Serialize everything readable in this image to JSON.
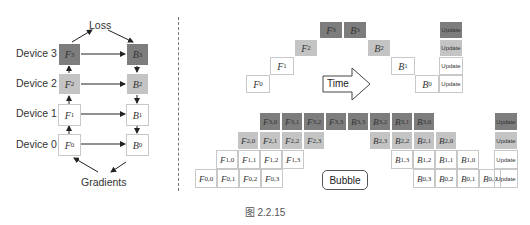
{
  "figure": {
    "caption": "图 2.2.15",
    "colors": {
      "dark": "#7d7d7d",
      "medium": "#c4c4c4",
      "light": "#ffffff",
      "border": "#c8c8c8"
    }
  },
  "left_diagram": {
    "top_label": "Loss",
    "bottom_label": "Gradients",
    "devices": [
      {
        "label": "Device 3",
        "forward": "F",
        "forward_sub": "3",
        "backward": "B",
        "backward_sub": "3",
        "shade": "dark"
      },
      {
        "label": "Device 2",
        "forward": "F",
        "forward_sub": "2",
        "backward": "B",
        "backward_sub": "2",
        "shade": "mid"
      },
      {
        "label": "Device 1",
        "forward": "F",
        "forward_sub": "1",
        "backward": "B",
        "backward_sub": "1",
        "shade": "white"
      },
      {
        "label": "Device 0",
        "forward": "F",
        "forward_sub": "0",
        "backward": "B",
        "backward_sub": "0",
        "shade": "white"
      }
    ]
  },
  "naive_pipeline": {
    "arrow_label": "Time",
    "cells": [
      {
        "text": "F",
        "sub": "0",
        "x": 246,
        "y": 75,
        "shade": "white"
      },
      {
        "text": "F",
        "sub": "1",
        "x": 270,
        "y": 57,
        "shade": "white"
      },
      {
        "text": "F",
        "sub": "2",
        "x": 294,
        "y": 39,
        "shade": "mid"
      },
      {
        "text": "F",
        "sub": "3",
        "x": 319,
        "y": 21,
        "shade": "dark"
      },
      {
        "text": "B",
        "sub": "3",
        "x": 343,
        "y": 21,
        "shade": "dark"
      },
      {
        "text": "B",
        "sub": "2",
        "x": 367,
        "y": 39,
        "shade": "mid"
      },
      {
        "text": "B",
        "sub": "1",
        "x": 391,
        "y": 57,
        "shade": "white"
      },
      {
        "text": "B",
        "sub": "0",
        "x": 415,
        "y": 75,
        "shade": "white"
      }
    ],
    "updates": [
      {
        "label": "Update",
        "shade": "dark"
      },
      {
        "label": "Update",
        "shade": "mid"
      },
      {
        "label": "Update",
        "shade": "white"
      },
      {
        "label": "Update",
        "shade": "white"
      }
    ]
  },
  "gpipe": {
    "bubble_label": "Bubble",
    "rows": [
      {
        "shade": "dark",
        "forward_start": 259,
        "backward_start": 347,
        "forward": [
          "3,0",
          "3,1",
          "3,2",
          "3,3"
        ],
        "backward": [
          "3,3",
          "3,2",
          "3,1",
          "3,0"
        ]
      },
      {
        "shade": "mid",
        "forward_start": 237,
        "backward_start": 369,
        "forward": [
          "2,0",
          "2,1",
          "2,2",
          "2,3"
        ],
        "backward": [
          "2,3",
          "2,2",
          "2,1",
          "2,0"
        ]
      },
      {
        "shade": "white",
        "forward_start": 216,
        "backward_start": 391,
        "forward": [
          "1,0",
          "1,1",
          "1,2",
          "1,3"
        ],
        "backward": [
          "1,3",
          "1,2",
          "1,1",
          "1,0"
        ]
      },
      {
        "shade": "white",
        "forward_start": 195,
        "backward_start": 413,
        "forward": [
          "0,0",
          "0,1",
          "0,2",
          "0,3"
        ],
        "backward": [
          "0,3",
          "0,2",
          "0,1",
          "0,0"
        ]
      }
    ],
    "updates": [
      {
        "label": "Update",
        "shade": "dark"
      },
      {
        "label": "Update",
        "shade": "mid"
      },
      {
        "label": "Update",
        "shade": "white"
      },
      {
        "label": "Update",
        "shade": "white"
      }
    ]
  }
}
